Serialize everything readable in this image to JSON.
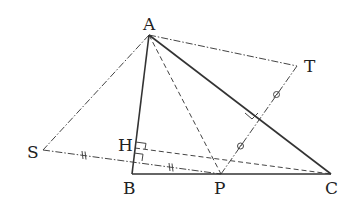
{
  "diagram": {
    "points": {
      "A": {
        "label": "A",
        "x": 149,
        "y": 35
      },
      "B": {
        "label": "B",
        "x": 132,
        "y": 174
      },
      "C": {
        "label": "C",
        "x": 331,
        "y": 174
      },
      "P": {
        "label": "P",
        "x": 221,
        "y": 174
      },
      "T": {
        "label": "T",
        "x": 297,
        "y": 66
      },
      "S": {
        "label": "S",
        "x": 43,
        "y": 150
      },
      "H": {
        "label": "H",
        "x": 135,
        "y": 148
      }
    },
    "segments": [
      {
        "from": "A",
        "to": "B",
        "style": "solid"
      },
      {
        "from": "A",
        "to": "C",
        "style": "solid"
      },
      {
        "from": "B",
        "to": "C",
        "style": "solid"
      },
      {
        "from": "A",
        "to": "S",
        "style": "dash-dot"
      },
      {
        "from": "A",
        "to": "T",
        "style": "dash-dot"
      },
      {
        "from": "S",
        "to": "P",
        "style": "dash-dot"
      },
      {
        "from": "P",
        "to": "T",
        "style": "dash-dot"
      },
      {
        "from": "A",
        "to": "P",
        "style": "dashed"
      },
      {
        "from": "H",
        "to": "C",
        "style": "dashed"
      }
    ],
    "marks": {
      "equal_ticks_SP": "double tick (||)",
      "equal_circles_PT": "circle (o)",
      "right_angles": [
        "H on AB (AB ⟂ HC)",
        "SP ⟂ AB",
        "PT ⟂ AC"
      ]
    }
  }
}
